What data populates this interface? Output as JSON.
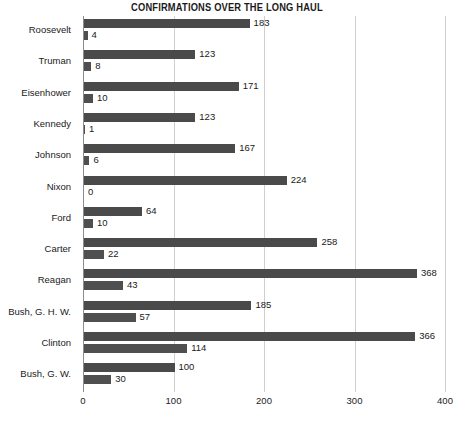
{
  "chart_data": {
    "type": "bar",
    "orientation": "horizontal",
    "title": "CONFIRMATIONS OVER THE LONG HAUL",
    "xlabel": "",
    "ylabel": "",
    "xlim": [
      0,
      400
    ],
    "xticks": [
      0,
      100,
      200,
      300,
      400
    ],
    "xtick_labels": [
      "0",
      "100",
      "200",
      "300",
      "400"
    ],
    "grid": true,
    "grid_axis": "x",
    "legend": "none",
    "bar_color": "#4a4a4a",
    "categories": [
      "Roosevelt",
      "Truman",
      "Eisenhower",
      "Kennedy",
      "Johnson",
      "Nixon",
      "Ford",
      "Carter",
      "Reagan",
      "Bush, G. H. W.",
      "Clinton",
      "Bush, G. W."
    ],
    "series": [
      {
        "name": "confirmations",
        "values": [
          183,
          123,
          171,
          123,
          167,
          224,
          64,
          258,
          368,
          185,
          366,
          100
        ]
      },
      {
        "name": "secondary",
        "values": [
          4,
          8,
          10,
          1,
          6,
          0,
          10,
          22,
          43,
          57,
          114,
          30
        ]
      }
    ],
    "value_labels": {
      "primary": [
        "183",
        "123",
        "171",
        "123",
        "167",
        "224",
        "64",
        "258",
        "368",
        "185",
        "366",
        "100"
      ],
      "secondary": [
        "4",
        "8",
        "10",
        "1",
        "6",
        "0",
        "10",
        "22",
        "43",
        "57",
        "114",
        "30"
      ]
    }
  }
}
